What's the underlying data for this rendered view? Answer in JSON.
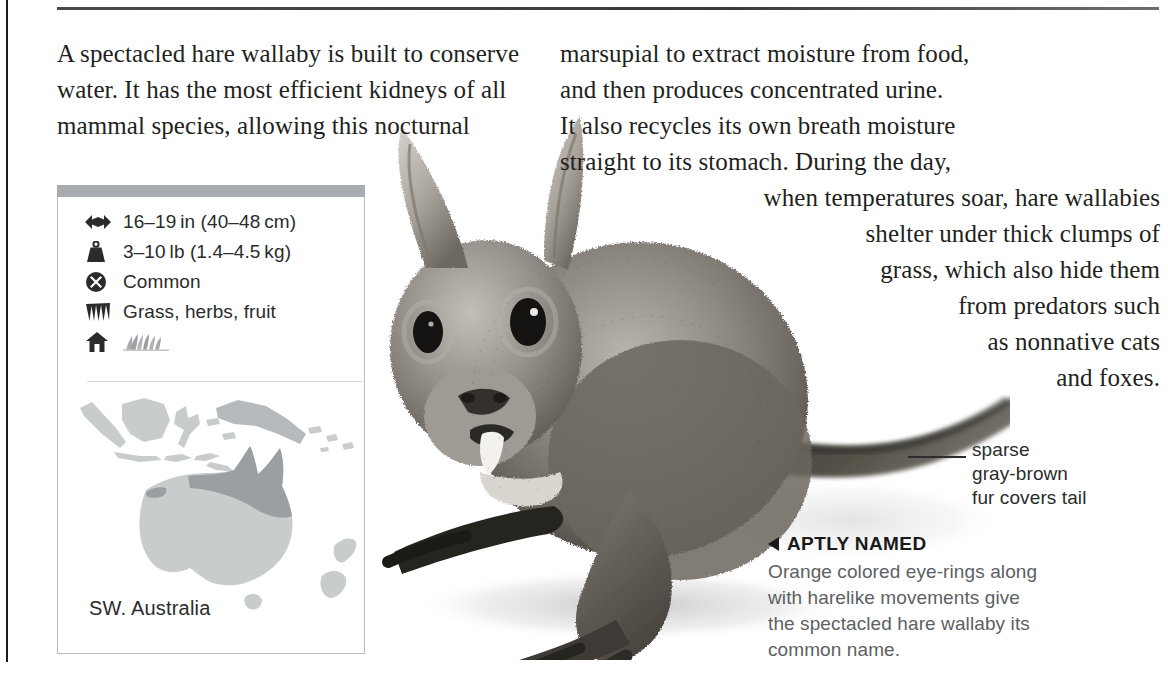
{
  "page": {
    "width": 1168,
    "height": 690,
    "background": "#ffffff",
    "rule_color": "#3a3a3a"
  },
  "body_text": {
    "left_column": "A spectacled hare wallaby is built to conserve water. It has the most efficient kidneys of all mammal species, allowing this nocturnal",
    "left_lines": [
      "A spectacled hare wallaby is built to conserve",
      "water. It has the most efficient kidneys of all",
      "mammal species, allowing this nocturnal"
    ],
    "right_column": "marsupial to extract moisture from food, and then produces concentrated urine. It also recycles its own breath moisture straight to its stomach. During the day, when temperatures soar, hare wallabies shelter under thick clumps of grass, which also hide them from predators such as nonnative cats and foxes.",
    "right_lines": [
      {
        "text": "marsupial to extract moisture from food,",
        "align": "left"
      },
      {
        "text": "and then produces concentrated urine.",
        "align": "left"
      },
      {
        "text": "It also recycles its own breath moisture",
        "align": "left"
      },
      {
        "text": "straight to its stomach. During the day,",
        "align": "left"
      },
      {
        "text": "when temperatures soar, hare wallabies",
        "align": "right"
      },
      {
        "text": "shelter under thick clumps of",
        "align": "right"
      },
      {
        "text": "grass, which also hide them",
        "align": "right"
      },
      {
        "text": "from predators such",
        "align": "right"
      },
      {
        "text": "as nonnative cats",
        "align": "right"
      },
      {
        "text": "and foxes.",
        "align": "right"
      }
    ]
  },
  "info_panel": {
    "header_bar_color": "#a8acb0",
    "border_color": "#b9bdc0",
    "facts": [
      {
        "icon": "size-arrows-icon",
        "label": "16–19 in (40–48 cm)"
      },
      {
        "icon": "weight-icon",
        "label": "3–10 lb (1.4–4.5 kg)"
      },
      {
        "icon": "status-circle-x-icon",
        "label": "Common"
      },
      {
        "icon": "diet-grass-icon",
        "label": "Grass, herbs, fruit"
      },
      {
        "icon": "habitat-house-icon",
        "label": ""
      }
    ],
    "habitat_icon": "grassland-icon",
    "map": {
      "label": "SW. Australia",
      "region_fill": "#c9cccd",
      "range_fill": "#9aa0a2",
      "title": "Oceania — Australia and New Guinea"
    }
  },
  "annotations": {
    "tail_note": {
      "lines": [
        "sparse",
        "gray-brown",
        "fur covers tail"
      ],
      "text": "sparse gray-brown fur covers tail"
    },
    "caption": {
      "marker": "left-triangle",
      "heading": "APTLY NAMED",
      "lines": [
        "Orange colored eye-rings along",
        "with harelike movements give",
        "the spectacled hare wallaby its",
        "common name."
      ],
      "body": "Orange colored eye-rings along with harelike movements give the spectacled hare wallaby its common name.",
      "body_color": "#5c6164"
    }
  },
  "photo": {
    "subject": "spectacled hare wallaby",
    "description": "Black-and-white photo of a spectacled hare wallaby sitting upright, long tail extending to the right"
  }
}
